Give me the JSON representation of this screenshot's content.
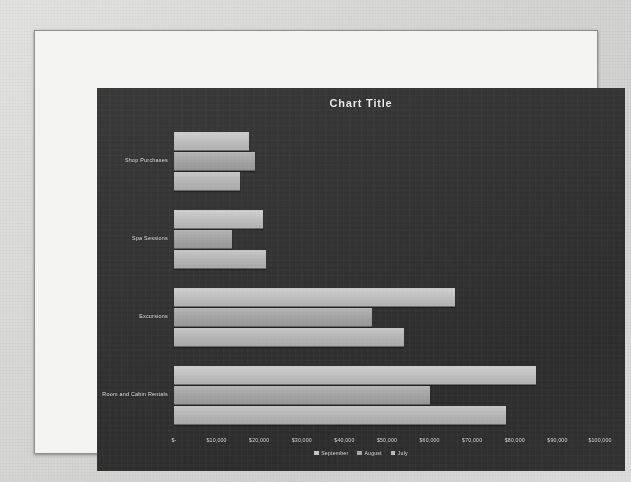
{
  "slide": {
    "chart_title": "Chart Title"
  },
  "chart_data": {
    "type": "bar",
    "orientation": "horizontal",
    "title": "Chart Title",
    "xlabel": "",
    "ylabel": "",
    "xlim": [
      0,
      100000
    ],
    "grid": false,
    "legend_position": "bottom",
    "categories": [
      "Shop Purchases",
      "Spa Sessions",
      "Excursions",
      "Room and Cabin Rentals"
    ],
    "x_tick_labels": [
      "$-",
      "$10,000",
      "$20,000",
      "$30,000",
      "$40,000",
      "$50,000",
      "$60,000",
      "$70,000",
      "$80,000",
      "$90,000",
      "$100,000"
    ],
    "x_tick_values": [
      0,
      10000,
      20000,
      30000,
      40000,
      50000,
      60000,
      70000,
      80000,
      90000,
      100000
    ],
    "series": [
      {
        "name": "September",
        "color": "#c3c3c3",
        "values": [
          17500,
          21000,
          66000,
          85000
        ]
      },
      {
        "name": "August",
        "color": "#a8a8a8",
        "values": [
          19000,
          13500,
          46500,
          60000
        ]
      },
      {
        "name": "July",
        "color": "#bababa",
        "values": [
          15500,
          21500,
          54000,
          78000
        ]
      }
    ]
  }
}
